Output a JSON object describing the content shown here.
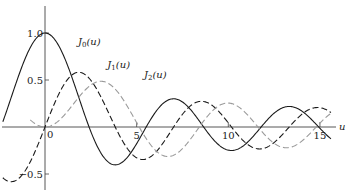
{
  "chart_data": {
    "type": "line",
    "title": "",
    "xlabel": "u",
    "ylabel": "",
    "xlim": [
      -2.3,
      16
    ],
    "ylim": [
      -0.6,
      1.1
    ],
    "x_ticks": [
      0,
      5,
      10,
      15
    ],
    "x_tick_labels": [
      "0",
      "5",
      "10",
      "15"
    ],
    "y_ticks": [
      1.0,
      0.5,
      -0.5
    ],
    "y_tick_labels": [
      "1.0",
      "0.5",
      "−0.5"
    ],
    "grid": false,
    "legend": "inline labels",
    "series": [
      {
        "name": "J0(u)",
        "label_main": "J",
        "label_sub": "0",
        "label_tail": "(u)",
        "style": "solid",
        "color": "#1a1a1a",
        "x": [
          -2.3,
          0,
          2.405,
          3.832,
          5.52,
          7.016,
          8.654,
          10.173,
          11.792,
          13.324,
          14.931,
          15.6
        ],
        "values": [
          0.056,
          1.0,
          0.0,
          -0.403,
          0.0,
          0.3,
          0.0,
          -0.25,
          0.0,
          0.218,
          0.0,
          -0.09
        ]
      },
      {
        "name": "J1(u)",
        "label_main": "J",
        "label_sub": "1",
        "label_tail": "(u)",
        "style": "dashed",
        "color": "#1a1a1a",
        "x": [
          -2.3,
          0,
          1.841,
          3.832,
          5.331,
          7.016,
          8.536,
          10.173,
          11.706,
          13.324,
          14.864,
          15.6
        ],
        "values": [
          -0.54,
          0.0,
          0.582,
          0.0,
          -0.346,
          0.0,
          0.273,
          0.0,
          -0.233,
          0.0,
          0.207,
          0.09
        ]
      },
      {
        "name": "J2(u)",
        "label_main": "J",
        "label_sub": "2",
        "label_tail": "(u)",
        "style": "dashed",
        "color": "#9a9a9a",
        "x": [
          -0.8,
          0,
          3.054,
          5.136,
          6.706,
          8.417,
          9.969,
          11.62,
          13.17,
          14.796,
          15.6
        ],
        "values": [
          0.07,
          0.0,
          0.486,
          0.0,
          -0.314,
          0.0,
          0.255,
          0.0,
          -0.22,
          0.0,
          0.1
        ]
      }
    ],
    "label_positions": {
      "J0(u)": [
        1.8,
        0.87
      ],
      "J1(u)": [
        3.4,
        0.63
      ],
      "J2(u)": [
        5.4,
        0.52
      ]
    }
  }
}
